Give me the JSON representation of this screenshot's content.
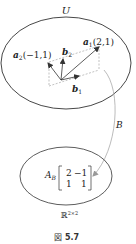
{
  "figure": {
    "caption_prefix": "図",
    "caption_number": "5.7"
  },
  "space_U": {
    "label": "U"
  },
  "vectors": {
    "a1": {
      "name": "a",
      "sub": "1",
      "coords": "(2,1)"
    },
    "a2": {
      "name": "a",
      "sub": "2",
      "coords": "(−1,1)"
    },
    "b1": {
      "name": "b",
      "sub": "1"
    },
    "b2": {
      "name": "b",
      "sub": "2"
    }
  },
  "mapping": {
    "label": "B"
  },
  "space_R": {
    "label": "ℝ",
    "superscript": "2×2"
  },
  "matrix": {
    "name": "A",
    "sub": "B",
    "rows": [
      [
        "2",
        "−1"
      ],
      [
        "1",
        "1"
      ]
    ]
  },
  "colors": {
    "stroke": "#333333",
    "dashed": "#999999",
    "arrow_curve": "#aaaaaa"
  }
}
